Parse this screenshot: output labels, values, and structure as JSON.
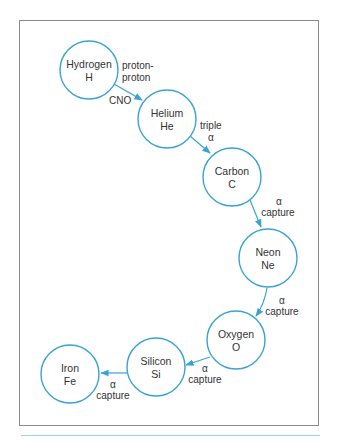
{
  "diagram": {
    "accent_color": "#3aa3d3",
    "nodes": [
      {
        "id": "hydrogen",
        "name": "Hydrogen",
        "symbol": "H"
      },
      {
        "id": "helium",
        "name": "Helium",
        "symbol": "He"
      },
      {
        "id": "carbon",
        "name": "Carbon",
        "symbol": "C"
      },
      {
        "id": "neon",
        "name": "Neon",
        "symbol": "Ne"
      },
      {
        "id": "oxygen",
        "name": "Oxygen",
        "symbol": "O"
      },
      {
        "id": "silicon",
        "name": "Silicon",
        "symbol": "Si"
      },
      {
        "id": "iron",
        "name": "Iron",
        "symbol": "Fe"
      }
    ],
    "edges": [
      {
        "from": "hydrogen",
        "to": "helium",
        "label_top_1": "proton-",
        "label_top_2": "proton",
        "label_bottom": "CNO"
      },
      {
        "from": "helium",
        "to": "carbon",
        "label_1": "triple",
        "label_2": "α"
      },
      {
        "from": "carbon",
        "to": "neon",
        "label_1": "α",
        "label_2": "capture"
      },
      {
        "from": "neon",
        "to": "oxygen",
        "label_1": "α",
        "label_2": "capture"
      },
      {
        "from": "oxygen",
        "to": "silicon",
        "label_1": "α",
        "label_2": "capture"
      },
      {
        "from": "silicon",
        "to": "iron",
        "label_1": "α",
        "label_2": "capture"
      }
    ]
  }
}
